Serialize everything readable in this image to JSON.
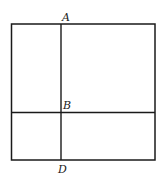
{
  "diagram": {
    "type": "geometry-figure",
    "labels": {
      "A": "A",
      "B": "B",
      "D": "D"
    },
    "stroke_color": "#1a1a1a",
    "background": "#ffffff"
  }
}
